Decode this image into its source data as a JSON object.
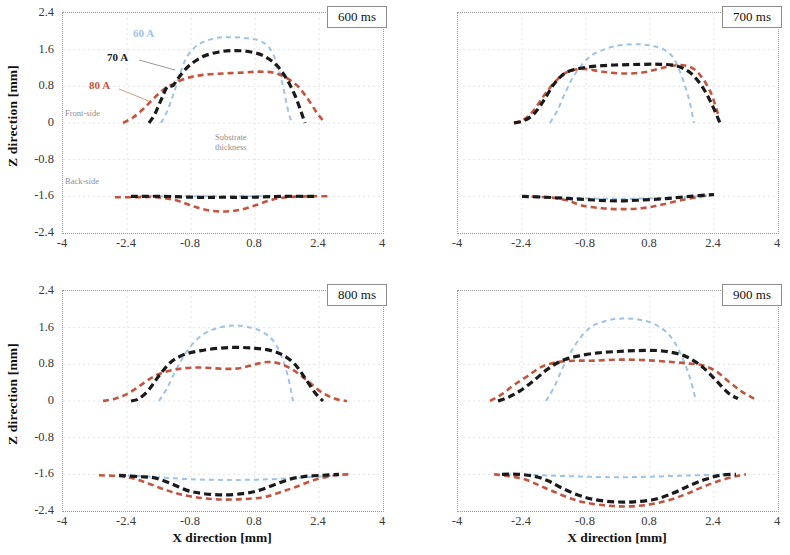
{
  "figure": {
    "axis": {
      "ylabel": "Z direction [mm]",
      "xlabel": "X direction [mm]",
      "yticks": [
        "2.4",
        "1.6",
        "0.8",
        "0",
        "-0.8",
        "-1.6",
        "-2.4"
      ],
      "xticks": [
        "-4",
        "-2.4",
        "-0.8",
        "0.8",
        "2.4",
        "4"
      ],
      "ylim": [
        -2.4,
        2.4
      ],
      "xlim": [
        -4,
        4
      ]
    },
    "annotations": {
      "front_side": "Front-side",
      "back_side": "Back-side",
      "substrate_thickness": "Substrate\nthickness"
    },
    "legend": [
      {
        "label": "60 A",
        "color": "#9dc3e6"
      },
      {
        "label": "70 A",
        "color": "#1a1a1a"
      },
      {
        "label": "80 A",
        "color": "#c1553f"
      }
    ],
    "panels": [
      {
        "time_label": "600 ms"
      },
      {
        "time_label": "700 ms"
      },
      {
        "time_label": "800 ms"
      },
      {
        "time_label": "900 ms"
      }
    ]
  },
  "chart_data": {
    "type": "line",
    "xlabel": "X direction [mm]",
    "ylabel": "Z direction [mm]",
    "xlim": [
      -4,
      4
    ],
    "ylim": [
      -2.4,
      2.4
    ],
    "xticks": [
      -4,
      -2.4,
      -0.8,
      0.8,
      2.4,
      4
    ],
    "yticks": [
      2.4,
      1.6,
      0.8,
      0,
      -0.8,
      -1.6,
      -2.4
    ],
    "grid": true,
    "legend_position": "inside-upper-left (panel 600 ms only)",
    "linestyle": "dashed",
    "annotations": [
      "Front-side",
      "Back-side",
      "Substrate thickness"
    ],
    "substrate": {
      "front_side_z": 0,
      "back_side_z": -1.6,
      "thickness_mm": 1.6
    },
    "panels": [
      {
        "time": "600 ms",
        "series": [
          {
            "name": "60 A",
            "color": "#9dc3e6",
            "side": "front",
            "x": [
              -1.55,
              -1.4,
              -1.25,
              -1.1,
              -0.9,
              -0.6,
              -0.2,
              0.2,
              0.6,
              0.9,
              1.15,
              1.35,
              1.5,
              1.62,
              1.72
            ],
            "y": [
              0.0,
              0.25,
              0.6,
              1.0,
              1.45,
              1.72,
              1.85,
              1.87,
              1.85,
              1.8,
              1.65,
              1.3,
              0.8,
              0.3,
              0.0
            ]
          },
          {
            "name": "70 A",
            "color": "#1a1a1a",
            "side": "front",
            "x": [
              -1.85,
              -1.7,
              -1.55,
              -1.4,
              -1.25,
              -1.1,
              -0.85,
              -0.5,
              -0.1,
              0.3,
              0.7,
              1.05,
              1.35,
              1.6,
              1.8,
              1.95,
              2.05
            ],
            "y": [
              0.0,
              0.2,
              0.5,
              0.78,
              0.82,
              1.0,
              1.25,
              1.45,
              1.55,
              1.58,
              1.55,
              1.45,
              1.25,
              0.95,
              0.6,
              0.25,
              0.0
            ]
          },
          {
            "name": "80 A",
            "color": "#c1553f",
            "side": "front",
            "x": [
              -2.5,
              -2.25,
              -2.0,
              -1.75,
              -1.5,
              -1.25,
              -0.9,
              -0.5,
              0.0,
              0.5,
              0.9,
              1.25,
              1.55,
              1.85,
              2.1,
              2.35,
              2.55
            ],
            "y": [
              0.0,
              0.12,
              0.3,
              0.52,
              0.72,
              0.85,
              0.98,
              1.05,
              1.08,
              1.1,
              1.12,
              1.1,
              1.0,
              0.82,
              0.55,
              0.22,
              0.0
            ]
          },
          {
            "name": "60 A",
            "color": "#9dc3e6",
            "side": "back",
            "x": [
              -2.3,
              -1.5,
              -0.7,
              0.0,
              0.7,
              1.5,
              2.3
            ],
            "y": [
              -1.6,
              -1.6,
              -1.6,
              -1.6,
              -1.6,
              -1.6,
              -1.6
            ]
          },
          {
            "name": "70 A",
            "color": "#1a1a1a",
            "side": "back",
            "x": [
              -2.3,
              -1.5,
              -0.7,
              0.0,
              0.7,
              1.5,
              2.3
            ],
            "y": [
              -1.6,
              -1.6,
              -1.62,
              -1.62,
              -1.62,
              -1.6,
              -1.6
            ]
          },
          {
            "name": "80 A",
            "color": "#c1553f",
            "side": "back",
            "x": [
              -2.7,
              -2.2,
              -1.7,
              -1.2,
              -0.8,
              -0.4,
              0.0,
              0.4,
              0.8,
              1.2,
              1.6,
              2.1,
              2.7
            ],
            "y": [
              -1.62,
              -1.62,
              -1.62,
              -1.68,
              -1.8,
              -1.9,
              -1.93,
              -1.9,
              -1.8,
              -1.68,
              -1.62,
              -1.6,
              -1.6
            ]
          }
        ]
      },
      {
        "time": "700 ms",
        "series": [
          {
            "name": "60 A",
            "color": "#9dc3e6",
            "side": "front",
            "x": [
              -1.7,
              -1.5,
              -1.3,
              -1.05,
              -0.7,
              -0.3,
              0.1,
              0.5,
              0.85,
              1.15,
              1.4,
              1.6,
              1.78,
              1.9
            ],
            "y": [
              0.0,
              0.3,
              0.7,
              1.1,
              1.45,
              1.62,
              1.7,
              1.72,
              1.68,
              1.6,
              1.4,
              1.0,
              0.5,
              0.0
            ]
          },
          {
            "name": "70 A",
            "color": "#1a1a1a",
            "side": "front",
            "x": [
              -2.6,
              -2.35,
              -2.1,
              -1.85,
              -1.6,
              -1.3,
              -0.9,
              -0.4,
              0.1,
              0.6,
              1.05,
              1.45,
              1.8,
              2.1,
              2.35,
              2.55
            ],
            "y": [
              0.0,
              0.05,
              0.2,
              0.5,
              0.85,
              1.1,
              1.2,
              1.25,
              1.27,
              1.28,
              1.28,
              1.25,
              1.1,
              0.8,
              0.4,
              0.0
            ]
          },
          {
            "name": "80 A",
            "color": "#c1553f",
            "side": "front",
            "x": [
              -2.6,
              -2.35,
              -2.1,
              -1.85,
              -1.55,
              -1.25,
              -0.85,
              -0.4,
              0.1,
              0.6,
              1.0,
              1.35,
              1.7,
              2.0,
              2.3,
              2.5
            ],
            "y": [
              0.0,
              0.08,
              0.28,
              0.6,
              0.92,
              1.12,
              1.18,
              1.12,
              1.08,
              1.1,
              1.18,
              1.25,
              1.25,
              1.1,
              0.7,
              0.2
            ]
          },
          {
            "name": "60 A",
            "color": "#9dc3e6",
            "side": "back",
            "x": [
              -2.4,
              -1.5,
              -0.5,
              0.5,
              1.5,
              2.4
            ],
            "y": [
              -1.6,
              -1.62,
              -1.65,
              -1.65,
              -1.62,
              -1.58
            ]
          },
          {
            "name": "70 A",
            "color": "#1a1a1a",
            "side": "back",
            "x": [
              -2.4,
              -1.8,
              -1.2,
              -0.6,
              0.0,
              0.6,
              1.2,
              1.8,
              2.4
            ],
            "y": [
              -1.6,
              -1.62,
              -1.65,
              -1.68,
              -1.7,
              -1.68,
              -1.65,
              -1.6,
              -1.56
            ]
          },
          {
            "name": "80 A",
            "color": "#c1553f",
            "side": "back",
            "x": [
              -2.4,
              -1.8,
              -1.3,
              -0.9,
              -0.4,
              0.1,
              0.6,
              1.1,
              1.6,
              2.1,
              2.4
            ],
            "y": [
              -1.6,
              -1.62,
              -1.68,
              -1.8,
              -1.86,
              -1.88,
              -1.86,
              -1.78,
              -1.68,
              -1.6,
              -1.56
            ]
          }
        ]
      },
      {
        "time": "800 ms",
        "series": [
          {
            "name": "60 A",
            "color": "#9dc3e6",
            "side": "front",
            "x": [
              -1.6,
              -1.4,
              -1.15,
              -0.85,
              -0.5,
              -0.1,
              0.3,
              0.7,
              1.0,
              1.25,
              1.45,
              1.62,
              1.75
            ],
            "y": [
              0.0,
              0.28,
              0.72,
              1.15,
              1.45,
              1.6,
              1.65,
              1.6,
              1.5,
              1.32,
              1.0,
              0.55,
              0.0
            ]
          },
          {
            "name": "70 A",
            "color": "#1a1a1a",
            "side": "front",
            "x": [
              -2.3,
              -2.1,
              -1.85,
              -1.6,
              -1.3,
              -0.95,
              -0.55,
              -0.1,
              0.35,
              0.8,
              1.2,
              1.5,
              1.8,
              2.05,
              2.3,
              2.5
            ],
            "y": [
              0.0,
              0.05,
              0.25,
              0.55,
              0.85,
              1.02,
              1.1,
              1.15,
              1.17,
              1.15,
              1.1,
              1.0,
              0.8,
              0.5,
              0.18,
              0.0
            ]
          },
          {
            "name": "80 A",
            "color": "#c1553f",
            "side": "front",
            "x": [
              -3.0,
              -2.7,
              -2.4,
              -2.1,
              -1.8,
              -1.5,
              -1.1,
              -0.7,
              -0.3,
              0.1,
              0.45,
              0.8,
              1.1,
              1.4,
              1.75,
              2.1,
              2.45,
              2.8,
              3.1
            ],
            "y": [
              0.0,
              0.05,
              0.15,
              0.32,
              0.5,
              0.62,
              0.7,
              0.73,
              0.72,
              0.7,
              0.72,
              0.8,
              0.85,
              0.82,
              0.68,
              0.45,
              0.2,
              0.05,
              0.0
            ]
          },
          {
            "name": "60 A",
            "color": "#9dc3e6",
            "side": "back",
            "x": [
              -2.6,
              -1.8,
              -1.0,
              -0.2,
              0.6,
              1.4,
              2.2,
              2.9
            ],
            "y": [
              -1.62,
              -1.65,
              -1.7,
              -1.72,
              -1.72,
              -1.7,
              -1.66,
              -1.62
            ]
          },
          {
            "name": "70 A",
            "color": "#1a1a1a",
            "side": "back",
            "x": [
              -2.6,
              -2.1,
              -1.7,
              -1.3,
              -0.9,
              -0.5,
              0.0,
              0.5,
              0.9,
              1.3,
              1.7,
              2.1,
              2.5,
              2.9
            ],
            "y": [
              -1.62,
              -1.65,
              -1.68,
              -1.8,
              -1.95,
              -2.02,
              -2.05,
              -2.02,
              -1.95,
              -1.82,
              -1.7,
              -1.64,
              -1.62,
              -1.6
            ]
          },
          {
            "name": "80 A",
            "color": "#c1553f",
            "side": "back",
            "x": [
              -3.1,
              -2.6,
              -2.2,
              -1.8,
              -1.4,
              -1.0,
              -0.5,
              0.0,
              0.5,
              1.0,
              1.4,
              1.8,
              2.3,
              2.8,
              3.2
            ],
            "y": [
              -1.62,
              -1.64,
              -1.7,
              -1.82,
              -1.95,
              -2.05,
              -2.12,
              -2.15,
              -2.14,
              -2.1,
              -2.0,
              -1.88,
              -1.72,
              -1.62,
              -1.6
            ]
          }
        ]
      },
      {
        "time": "900 ms",
        "series": [
          {
            "name": "60 A",
            "color": "#9dc3e6",
            "side": "front",
            "x": [
              -1.8,
              -1.6,
              -1.35,
              -1.05,
              -0.7,
              -0.3,
              0.1,
              0.5,
              0.85,
              1.15,
              1.4,
              1.62,
              1.8,
              1.95
            ],
            "y": [
              0.0,
              0.3,
              0.78,
              1.25,
              1.6,
              1.75,
              1.8,
              1.78,
              1.7,
              1.55,
              1.3,
              0.92,
              0.5,
              0.0
            ]
          },
          {
            "name": "70 A",
            "color": "#1a1a1a",
            "side": "front",
            "x": [
              -3.0,
              -2.75,
              -2.45,
              -2.1,
              -1.75,
              -1.4,
              -1.0,
              -0.5,
              0.0,
              0.5,
              1.0,
              1.4,
              1.75,
              2.1,
              2.45,
              2.75,
              3.0
            ],
            "y": [
              0.0,
              0.08,
              0.22,
              0.45,
              0.7,
              0.88,
              0.98,
              1.05,
              1.08,
              1.1,
              1.1,
              1.05,
              0.95,
              0.75,
              0.45,
              0.18,
              0.05
            ]
          },
          {
            "name": "80 A",
            "color": "#c1553f",
            "side": "front",
            "x": [
              -3.2,
              -2.9,
              -2.6,
              -2.25,
              -1.9,
              -1.5,
              -1.05,
              -0.6,
              -0.1,
              0.4,
              0.9,
              1.35,
              1.75,
              2.1,
              2.45,
              2.8,
              3.1,
              3.4
            ],
            "y": [
              0.0,
              0.15,
              0.35,
              0.55,
              0.75,
              0.85,
              0.88,
              0.88,
              0.9,
              0.9,
              0.88,
              0.85,
              0.82,
              0.78,
              0.65,
              0.4,
              0.2,
              0.05
            ]
          },
          {
            "name": "60 A",
            "color": "#9dc3e6",
            "side": "back",
            "x": [
              -2.8,
              -2.0,
              -1.2,
              -0.4,
              0.4,
              1.2,
              2.0,
              2.8
            ],
            "y": [
              -1.6,
              -1.62,
              -1.64,
              -1.66,
              -1.66,
              -1.64,
              -1.62,
              -1.6
            ]
          },
          {
            "name": "70 A",
            "color": "#1a1a1a",
            "side": "back",
            "x": [
              -2.9,
              -2.5,
              -2.1,
              -1.75,
              -1.4,
              -1.0,
              -0.6,
              -0.1,
              0.4,
              0.9,
              1.35,
              1.75,
              2.15,
              2.55,
              2.95
            ],
            "y": [
              -1.6,
              -1.6,
              -1.64,
              -1.74,
              -1.9,
              -2.05,
              -2.15,
              -2.2,
              -2.2,
              -2.15,
              -2.02,
              -1.86,
              -1.72,
              -1.62,
              -1.6
            ]
          },
          {
            "name": "80 A",
            "color": "#c1553f",
            "side": "back",
            "x": [
              -3.1,
              -2.7,
              -2.3,
              -1.95,
              -1.6,
              -1.2,
              -0.8,
              -0.3,
              0.2,
              0.7,
              1.2,
              1.65,
              2.05,
              2.5,
              2.95,
              3.2
            ],
            "y": [
              -1.6,
              -1.64,
              -1.72,
              -1.85,
              -1.98,
              -2.12,
              -2.22,
              -2.28,
              -2.3,
              -2.27,
              -2.18,
              -2.05,
              -1.9,
              -1.75,
              -1.64,
              -1.6
            ]
          }
        ]
      }
    ]
  }
}
